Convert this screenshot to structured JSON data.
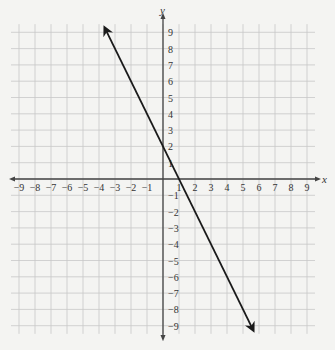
{
  "chart_data": {
    "type": "line",
    "title": "",
    "xlabel": "x",
    "ylabel": "y",
    "xlim": [
      -9,
      9
    ],
    "ylim": [
      -9,
      9
    ],
    "grid": true,
    "x_ticks": [
      -9,
      -8,
      -7,
      -6,
      -5,
      -4,
      -3,
      -2,
      -1,
      1,
      2,
      3,
      4,
      5,
      6,
      7,
      8,
      9
    ],
    "y_ticks": [
      9,
      8,
      7,
      6,
      5,
      4,
      3,
      2,
      1,
      -1,
      -2,
      -3,
      -4,
      -5,
      -6,
      -7,
      -8,
      -9
    ],
    "series": [
      {
        "name": "line",
        "equation": "y = -2x + 2",
        "slope": -2,
        "y_intercept": 2,
        "x_intercept": 1,
        "arrows_both_ends": true,
        "points": [
          [
            -3.6,
            9.2
          ],
          [
            0,
            2
          ],
          [
            1,
            0
          ],
          [
            5.6,
            -9.2
          ]
        ]
      }
    ]
  },
  "colors": {
    "background": "#f4f4f2",
    "grid": "#c8c8c8",
    "axis": "#444444",
    "line": "#1a1a1a"
  }
}
